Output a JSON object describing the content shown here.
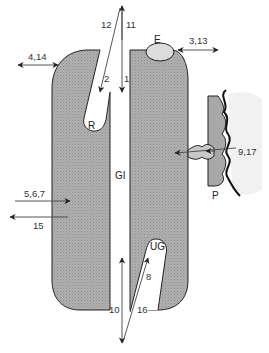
{
  "diagram": {
    "regions": {
      "E": "E",
      "R": "R",
      "GI": "GI",
      "UG": "UG",
      "P": "P"
    },
    "arrows": {
      "a1": "1",
      "a2": "2",
      "a11": "11",
      "a12": "12",
      "a4_14": "4,14",
      "a3_13": "3,13",
      "a9_17": "9,17",
      "a5_6_7": "5,6,7",
      "a15": "15",
      "a8": "8",
      "a10": "10",
      "a16": "16"
    },
    "colors": {
      "tissue_fill": "#a8a8a8",
      "outline": "#222222",
      "arrow": "#222222",
      "shade": "#eeeeee",
      "background": "#ffffff"
    }
  }
}
